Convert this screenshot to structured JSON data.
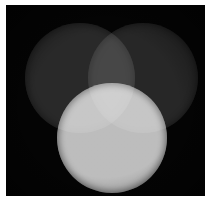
{
  "canvas": {
    "background_color": "#040404",
    "page_background_color": "#ffffff",
    "left": 6,
    "top": 5,
    "width": 199,
    "height": 191
  },
  "chart_data": {
    "type": "venn",
    "title": "",
    "subtitle": "",
    "xlabel": "",
    "ylabel": "",
    "legend_position": "none",
    "grid": false,
    "background_color": "#040404",
    "blend_mode": "additive-screen",
    "categories": [
      "top-left circle",
      "top-right circle",
      "bottom circle"
    ],
    "values": [
      38,
      36,
      188
    ],
    "circles": [
      {
        "name": "top-left circle",
        "label": "",
        "cx": 74,
        "cy": 73,
        "r": 55,
        "color": "#262626",
        "brightness": 38,
        "opacity": 1.0
      },
      {
        "name": "top-right circle",
        "label": "",
        "cx": 137,
        "cy": 73,
        "r": 55,
        "color": "#242424",
        "brightness": 36,
        "opacity": 1.0
      },
      {
        "name": "bottom circle",
        "label": "",
        "cx": 106,
        "cy": 133,
        "r": 55,
        "color": "#bcbcbc",
        "brightness": 188,
        "opacity": 1.0
      }
    ],
    "regions": [
      {
        "name": "background",
        "members": [],
        "color": "#040404",
        "brightness": 4
      },
      {
        "name": "top-left only",
        "members": [
          "top-left circle"
        ],
        "color": "#262626",
        "brightness": 38
      },
      {
        "name": "top-right only",
        "members": [
          "top-right circle"
        ],
        "color": "#242424",
        "brightness": 36
      },
      {
        "name": "bottom only",
        "members": [
          "bottom circle"
        ],
        "color": "#bcbcbc",
        "brightness": 188
      },
      {
        "name": "top-left and top-right",
        "members": [
          "top-left circle",
          "top-right circle"
        ],
        "color": "#484848",
        "brightness": 72
      },
      {
        "name": "top-left and bottom",
        "members": [
          "top-left circle",
          "bottom circle"
        ],
        "color": "#d2d2d2",
        "brightness": 210
      },
      {
        "name": "top-right and bottom",
        "members": [
          "top-right circle",
          "bottom circle"
        ],
        "color": "#d0d0d0",
        "brightness": 208
      },
      {
        "name": "all three",
        "members": [
          "top-left circle",
          "top-right circle",
          "bottom circle"
        ],
        "color": "#ededed",
        "brightness": 237
      }
    ],
    "axis_ranges": {
      "x": [
        0,
        199
      ],
      "y": [
        0,
        191
      ]
    }
  }
}
